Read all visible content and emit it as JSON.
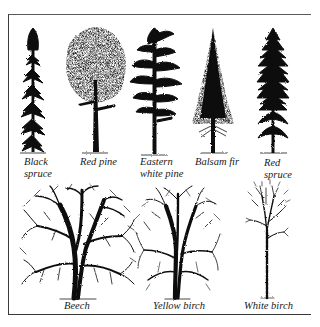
{
  "figure": {
    "type": "tree-silhouette-identification-chart",
    "top_row": [
      {
        "id": "black-spruce",
        "label_line1": "Black",
        "label_line2": "spruce"
      },
      {
        "id": "red-pine",
        "label_line1": "Red pine",
        "label_line2": ""
      },
      {
        "id": "eastern-white-pine",
        "label_line1": "Eastern",
        "label_line2": "white pine"
      },
      {
        "id": "balsam-fir",
        "label_line1": "Balsam fir",
        "label_line2": ""
      },
      {
        "id": "red-spruce",
        "label_line1": "Red",
        "label_line2": "spruce"
      }
    ],
    "bottom_row": [
      {
        "id": "beech",
        "label_line1": "Beech"
      },
      {
        "id": "yellow-birch",
        "label_line1": "Yellow birch"
      },
      {
        "id": "white-birch",
        "label_line1": "White birch"
      }
    ],
    "colors": {
      "ink": "#111111",
      "background": "#ffffff",
      "frame": "#3a3a3a"
    }
  }
}
